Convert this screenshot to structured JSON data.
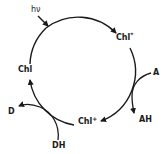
{
  "diagram": {
    "type": "cycle",
    "title": "",
    "nodes": {
      "light": {
        "label": "hν"
      },
      "excited": {
        "label": "Chl",
        "sup": "*"
      },
      "oxidized": {
        "label": "Chl",
        "sup": "+"
      },
      "ground": {
        "label": "Chl"
      }
    },
    "side_reactions": {
      "acceptor_in": {
        "label": "A"
      },
      "acceptor_out": {
        "label": "AH"
      },
      "donor_in": {
        "label": "DH"
      },
      "donor_out": {
        "label": "D"
      }
    },
    "edges": [
      {
        "from": "hν",
        "to": "cycle",
        "kind": "input"
      },
      {
        "from": "Chl",
        "to": "Chl*",
        "kind": "cycle"
      },
      {
        "from": "Chl*",
        "to": "Chl+",
        "kind": "cycle",
        "side": "A → AH"
      },
      {
        "from": "Chl+",
        "to": "Chl",
        "kind": "cycle",
        "side": "DH → D"
      }
    ],
    "colors": {
      "stroke": "#1a1a1a",
      "background": "#ffffff"
    }
  }
}
